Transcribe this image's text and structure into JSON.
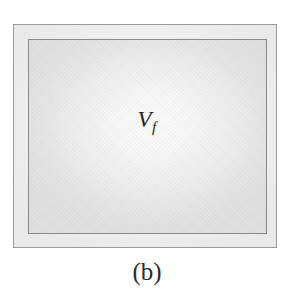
{
  "figure": {
    "caption": "(b)",
    "label": {
      "base": "V",
      "subscript": "f",
      "full": "V_f"
    },
    "colors": {
      "page_background": "#ffffff",
      "outer_border": "#9a9a9a",
      "inner_border": "#8a8a8a",
      "outer_fill": "#f0f0f0",
      "inner_fill_center": "#fcfcfc",
      "inner_fill_edge": "#e0e0e0",
      "text": "#262626"
    },
    "shapes": [
      {
        "name": "outer-boundary-rectangle",
        "x": 13,
        "y": 24,
        "width": 264,
        "height": 224
      },
      {
        "name": "inner-control-volume-rectangle",
        "x": 27,
        "y": 38,
        "width": 239,
        "height": 195
      }
    ]
  }
}
